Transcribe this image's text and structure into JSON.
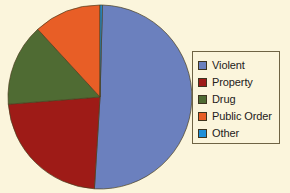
{
  "background_color": "#fbf5dc",
  "chart_data": {
    "type": "pie",
    "title": "",
    "subtitle": "",
    "xlabel": "",
    "ylabel": "",
    "grid": false,
    "legend_position": "right",
    "start_angle_deg": 0,
    "direction": "clockwise",
    "center": {
      "x": 100,
      "y": 97
    },
    "radius": 92,
    "categories": [
      "Violent",
      "Property",
      "Drug",
      "Public Order",
      "Other"
    ],
    "values": [
      50.5,
      22.8,
      14.4,
      11.9,
      0.4
    ],
    "units": "percent",
    "colors": [
      "#6b80be",
      "#9e1b17",
      "#4f6b33",
      "#e85e26",
      "#1f8fd8"
    ],
    "slices": [
      {
        "label": "Violent",
        "value": 50.5,
        "color": "#6b80be",
        "start_deg": 1.5,
        "end_deg": 183.5
      },
      {
        "label": "Property",
        "value": 22.8,
        "color": "#9e1b17",
        "start_deg": 183.5,
        "end_deg": 265.5
      },
      {
        "label": "Drug",
        "value": 14.4,
        "color": "#4f6b33",
        "start_deg": 265.5,
        "end_deg": 317.4
      },
      {
        "label": "Public Order",
        "value": 11.9,
        "color": "#e85e26",
        "start_deg": 317.4,
        "end_deg": 360.0
      },
      {
        "label": "Other",
        "value": 0.4,
        "color": "#1f8fd8",
        "start_deg": 0.0,
        "end_deg": 1.5
      }
    ],
    "annotations": []
  },
  "legend": {
    "items": [
      {
        "label": "Violent",
        "color": "#6b80be"
      },
      {
        "label": "Property",
        "color": "#9e1b17"
      },
      {
        "label": "Drug",
        "color": "#4f6b33"
      },
      {
        "label": "Public Order",
        "color": "#e85e26"
      },
      {
        "label": "Other",
        "color": "#1f8fd8"
      }
    ]
  }
}
